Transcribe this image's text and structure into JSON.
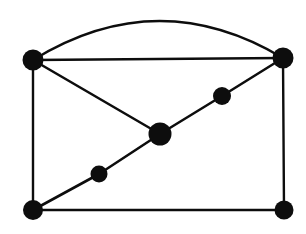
{
  "figure": {
    "background_color": "#ffffff",
    "ink_color": "#0d0d0d",
    "width": 306,
    "height": 234
  },
  "chart_data": {
    "type": "diagram",
    "diagram_kind": "graph",
    "title": "",
    "xlabel": "",
    "ylabel": "",
    "grid": false,
    "legend": null,
    "annotations": [],
    "vertex_count": 7,
    "edge_count": 9,
    "nodes": [
      {
        "id": "A",
        "name": "top-left-vertex",
        "x": 33,
        "y": 60,
        "r": 10.5,
        "degree": 4
      },
      {
        "id": "B",
        "name": "top-right-vertex",
        "x": 283,
        "y": 58,
        "r": 10.5,
        "degree": 5
      },
      {
        "id": "C",
        "name": "bottom-left-vertex",
        "x": 33,
        "y": 210,
        "r": 10.0,
        "degree": 3
      },
      {
        "id": "D",
        "name": "bottom-right-vertex",
        "x": 284,
        "y": 210,
        "r": 9.5,
        "degree": 2
      },
      {
        "id": "E",
        "name": "center-vertex",
        "x": 160,
        "y": 134,
        "r": 11.5,
        "degree": 4
      },
      {
        "id": "F",
        "name": "lower-diagonal-vertex",
        "x": 99,
        "y": 174,
        "r": 8.5,
        "degree": 2
      },
      {
        "id": "G",
        "name": "upper-diagonal-vertex",
        "x": 222,
        "y": 96,
        "r": 9.0,
        "degree": 2
      }
    ],
    "edges": [
      {
        "id": "e1",
        "name": "arc-top-left-to-top-right",
        "from": "A",
        "to": "B",
        "shape": "arc",
        "curve_apex_y": 21,
        "stroke_width": 2.4
      },
      {
        "id": "e2",
        "name": "top-horizontal-edge",
        "from": "A",
        "to": "B",
        "shape": "line",
        "stroke_width": 2.4
      },
      {
        "id": "e3",
        "name": "left-vertical-edge",
        "from": "A",
        "to": "C",
        "shape": "line",
        "stroke_width": 2.4
      },
      {
        "id": "e4",
        "name": "right-vertical-edge",
        "from": "B",
        "to": "D",
        "shape": "line",
        "stroke_width": 2.4
      },
      {
        "id": "e5",
        "name": "bottom-horizontal-edge",
        "from": "C",
        "to": "D",
        "shape": "line",
        "stroke_width": 2.6
      },
      {
        "id": "e6",
        "name": "top-left-to-center-edge",
        "from": "A",
        "to": "E",
        "shape": "line",
        "stroke_width": 2.6
      },
      {
        "id": "e7",
        "name": "bottom-left-to-lower-diagonal-edge",
        "from": "C",
        "to": "F",
        "shape": "line",
        "stroke_width": 2.6
      },
      {
        "id": "e8",
        "name": "lower-diagonal-to-center-edge",
        "from": "F",
        "to": "E",
        "shape": "line",
        "stroke_width": 2.6
      },
      {
        "id": "e9",
        "name": "center-to-upper-diagonal-edge",
        "from": "E",
        "to": "G",
        "shape": "line",
        "stroke_width": 2.6
      },
      {
        "id": "e10",
        "name": "upper-diagonal-to-top-right-edge",
        "from": "G",
        "to": "B",
        "shape": "line",
        "stroke_width": 2.6
      }
    ]
  }
}
